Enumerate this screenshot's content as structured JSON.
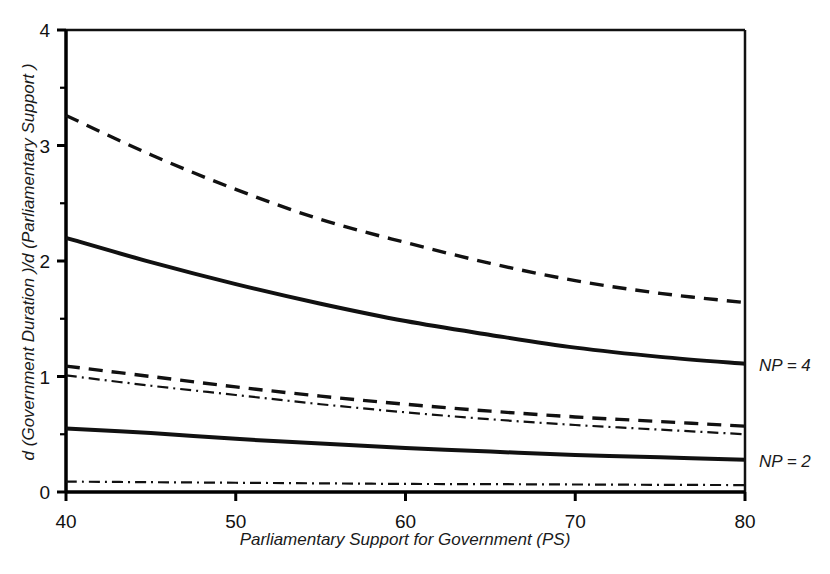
{
  "chart_data": {
    "type": "line",
    "title": "",
    "subtitle": "",
    "xlabel": "Parliamentary Support for Government (PS)",
    "ylabel": "d (Government Duration )/d (Parliamentary Support )",
    "xlim": [
      40,
      80
    ],
    "ylim": [
      0,
      4
    ],
    "xticks": [
      40,
      50,
      60,
      70,
      80
    ],
    "yticks": [
      0,
      1,
      2,
      3,
      4
    ],
    "xtick_labels": [
      "40",
      "50",
      "60",
      "70",
      "80"
    ],
    "ytick_labels": [
      "0",
      "1",
      "2",
      "3",
      "4"
    ],
    "grid": false,
    "legend_position": "right-annotations",
    "annotations": [
      {
        "text": "NP = 4",
        "x": 80,
        "y": 1.11
      },
      {
        "text": "NP = 2",
        "x": 80,
        "y": 0.28
      }
    ],
    "x": [
      40,
      45,
      50,
      55,
      60,
      65,
      70,
      75,
      80
    ],
    "series": [
      {
        "name": "NP = 4 upper (dashed)",
        "style": "dashed",
        "group": "NP = 4",
        "values": [
          3.26,
          2.92,
          2.62,
          2.36,
          2.16,
          1.98,
          1.83,
          1.72,
          1.64
        ]
      },
      {
        "name": "NP = 4 lower (solid)",
        "style": "solid",
        "group": "NP = 4",
        "values": [
          2.2,
          1.99,
          1.8,
          1.63,
          1.48,
          1.36,
          1.25,
          1.17,
          1.11
        ]
      },
      {
        "name": "NP = 2 upper (dashed)",
        "style": "dashed",
        "group": "NP = 2",
        "values": [
          1.09,
          1.0,
          0.91,
          0.83,
          0.76,
          0.7,
          0.65,
          0.61,
          0.57
        ]
      },
      {
        "name": "NP = 2 upper (dash-dot)",
        "style": "dash-dot",
        "group": "NP = 2",
        "values": [
          1.01,
          0.92,
          0.84,
          0.76,
          0.69,
          0.63,
          0.58,
          0.54,
          0.5
        ]
      },
      {
        "name": "NP = 2 lower (solid)",
        "style": "solid",
        "group": "NP = 2",
        "values": [
          0.55,
          0.51,
          0.46,
          0.42,
          0.38,
          0.35,
          0.32,
          0.3,
          0.28
        ]
      },
      {
        "name": "NP = 2 lower (dash-dot)",
        "style": "dash-dot",
        "group": "NP = 2",
        "values": [
          0.09,
          0.085,
          0.08,
          0.075,
          0.07,
          0.068,
          0.065,
          0.062,
          0.06
        ]
      }
    ],
    "colors": {
      "line": "#111111",
      "axis": "#000000",
      "background": "#ffffff"
    }
  }
}
